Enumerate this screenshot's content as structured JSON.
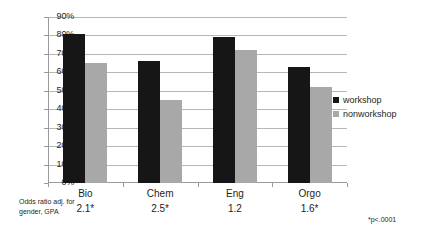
{
  "chart_data": {
    "type": "bar",
    "title": "",
    "subtitle": "",
    "xlabel": "",
    "ylabel": "",
    "categories": [
      "Bio",
      "Chem",
      "Eng",
      "Orgo"
    ],
    "series": [
      {
        "name": "workshop",
        "color": "#161616",
        "values": [
          81,
          66,
          79,
          63
        ]
      },
      {
        "name": "nonworkshop",
        "color": "#a8a8a8",
        "values": [
          65,
          45,
          72,
          52
        ]
      }
    ],
    "ylim": [
      0,
      90
    ],
    "ytick_labels": [
      "0%",
      "10%",
      "20%",
      "30%",
      "40%",
      "50%",
      "60%",
      "70%",
      "80%",
      "90%"
    ],
    "ytick_values": [
      0,
      10,
      20,
      30,
      40,
      50,
      60,
      70,
      80,
      90
    ],
    "grid": true,
    "legend_position": "right",
    "annotations": {
      "odds_ratios": [
        "2.1*",
        "2.5*",
        "1.2",
        "1.6*"
      ],
      "caption": "Odds ratio adj. for gender, GPA",
      "footnote": "*p<.0001"
    }
  },
  "legend": {
    "items": [
      {
        "label": "workshop"
      },
      {
        "label": "nonworkshop"
      }
    ]
  },
  "axis": {
    "y_labels": [
      "90%",
      "80%",
      "70%",
      "60%",
      "50%",
      "40%",
      "30%",
      "20%",
      "10%",
      "0%"
    ]
  },
  "caption": {
    "text": "Odds ratio adj. for gender, GPA"
  },
  "footnote": {
    "text": "*p<.0001"
  },
  "colors": {
    "workshop": "#161616",
    "nonworkshop": "#a8a8a8",
    "gridline": "#b7b7b7",
    "axis": "#9a9a9a",
    "text": "#231f20"
  }
}
